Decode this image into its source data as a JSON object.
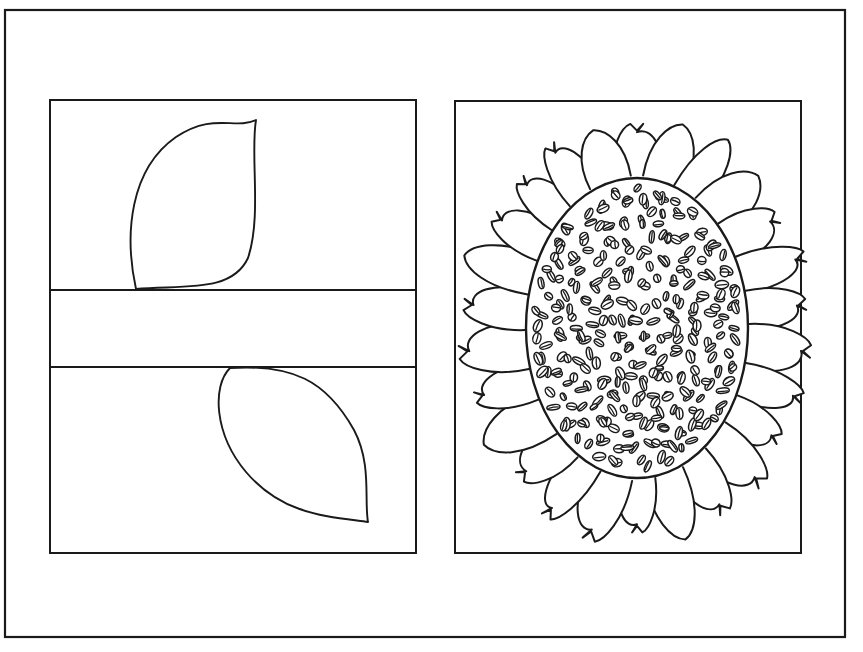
{
  "page": {
    "width": 863,
    "height": 652,
    "background_color": "#ffffff",
    "ink_color": "#1a1a1a",
    "document_type": "coloring-page",
    "clipped_header_text": "Sunflower coloring page"
  },
  "outer_frame": {
    "label": "page-border",
    "x": 5,
    "y": 10,
    "width": 840,
    "height": 627,
    "stroke_width": 2.2
  },
  "left_panel": {
    "label": "leaf-panel",
    "x": 50,
    "y": 100,
    "width": 366,
    "height": 453,
    "stroke_width": 2,
    "dividers_y": [
      290,
      367
    ],
    "bands": [
      {
        "name": "upper-band",
        "content": "leaf-pointing-up-right"
      },
      {
        "name": "middle-band",
        "content": "empty"
      },
      {
        "name": "lower-band",
        "content": "leaf-pointing-down-right"
      }
    ],
    "shapes": [
      {
        "name": "leaf-top",
        "tip_x": 256,
        "tip_y": 120,
        "base_x": 136,
        "base_y": 289,
        "orientation": "up-right"
      },
      {
        "name": "leaf-bottom",
        "tip_x": 368,
        "tip_y": 522,
        "base_x": 230,
        "base_y": 368,
        "orientation": "down-right"
      }
    ]
  },
  "right_panel": {
    "label": "sunflower-panel",
    "x": 455,
    "y": 101,
    "width": 346,
    "height": 452,
    "stroke_width": 2,
    "flower": {
      "name": "sunflower",
      "center_x": 637,
      "center_y": 328,
      "disc_radius_x": 111,
      "disc_radius_y": 150,
      "petal_count": 26,
      "petal_length": 58,
      "petal_half_width": 25,
      "seed_count": 300,
      "seed_radius_x": 5.6,
      "seed_radius_y": 3.6
    }
  },
  "colors": {
    "ink": "#1a1a1a",
    "paper": "#ffffff"
  }
}
